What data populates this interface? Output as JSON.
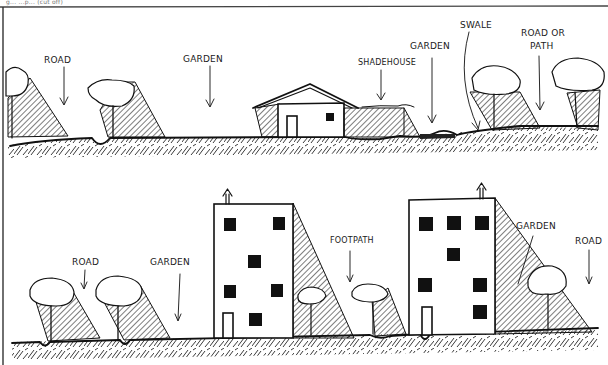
{
  "diagram": {
    "type": "landscape-cross-section-sketch",
    "caption_fragment": "g... ...p... (cut off)",
    "style": {
      "ink_color": "#111111",
      "paper_color": "#ffffff"
    }
  },
  "sections": [
    {
      "id": "top",
      "description": "Low-density section: trees beside road, garden, house, shadehouse, garden, swale, trees beside road or path",
      "labels": [
        {
          "id": "road",
          "text": "ROAD"
        },
        {
          "id": "garden-1",
          "text": "GARDEN"
        },
        {
          "id": "shadehouse",
          "text": "SHADEHOUSE"
        },
        {
          "id": "garden-2",
          "text": "GARDEN"
        },
        {
          "id": "swale",
          "text": "SWALE"
        },
        {
          "id": "road-or-path-1",
          "text": "ROAD OR"
        },
        {
          "id": "road-or-path-2",
          "text": "PATH"
        }
      ],
      "elements": [
        "tree",
        "road-dip",
        "tree",
        "house",
        "shadehouse",
        "garden-bed",
        "swale",
        "tree",
        "tree"
      ]
    },
    {
      "id": "bottom",
      "description": "Higher-density section: trees beside road, garden, multi-storey building, footpath with small trees, multi-storey building, garden, tree, road",
      "labels": [
        {
          "id": "road",
          "text": "ROAD"
        },
        {
          "id": "garden-1",
          "text": "GARDEN"
        },
        {
          "id": "footpath",
          "text": "FOOTPATH"
        },
        {
          "id": "garden-2",
          "text": "GARDEN"
        },
        {
          "id": "road-2",
          "text": "ROAD"
        }
      ],
      "elements": [
        "tree",
        "tree",
        "building-4-storey",
        "small-tree",
        "small-tree",
        "building-4-storey",
        "tree"
      ]
    }
  ]
}
